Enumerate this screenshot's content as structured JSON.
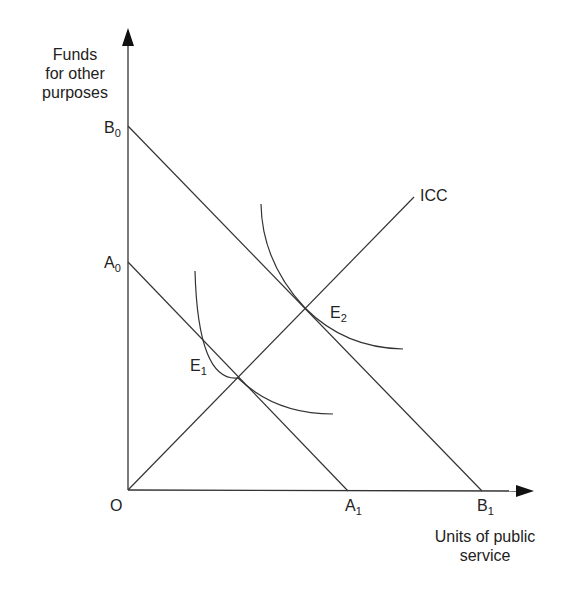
{
  "diagram": {
    "type": "indifference-curve diagram",
    "y_axis_title": [
      "Funds",
      "for other",
      "purposes"
    ],
    "x_axis_title": [
      "Units of public",
      "service"
    ],
    "origin_label": "O",
    "points": {
      "B0": {
        "base": "B",
        "sub": "0"
      },
      "A0": {
        "base": "A",
        "sub": "0"
      },
      "A1": {
        "base": "A",
        "sub": "1"
      },
      "B1": {
        "base": "B",
        "sub": "1"
      },
      "E1": {
        "base": "E",
        "sub": "1"
      },
      "E2": {
        "base": "E",
        "sub": "2"
      }
    },
    "icc_label": "ICC",
    "lines": [
      {
        "name": "budget-line-A",
        "from": "A0",
        "to": "A1"
      },
      {
        "name": "budget-line-B",
        "from": "B0",
        "to": "B1"
      },
      {
        "name": "income-consumption-curve",
        "from": "O",
        "to": "ICC"
      }
    ],
    "curves": [
      {
        "name": "indifference-curve-1",
        "tangent_at": "E1"
      },
      {
        "name": "indifference-curve-2",
        "tangent_at": "E2"
      }
    ],
    "line_color": "#333333"
  }
}
